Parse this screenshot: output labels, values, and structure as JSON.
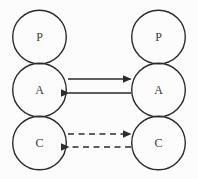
{
  "colors": {
    "background": "#fcfcfc",
    "stroke": "#2b2b2b",
    "text": "#3a3a3a"
  },
  "diagram": {
    "type": "ego-state-circles",
    "left_column": {
      "nodes": [
        {
          "label": "P"
        },
        {
          "label": "A"
        },
        {
          "label": "C"
        }
      ]
    },
    "right_column": {
      "nodes": [
        {
          "label": "P"
        },
        {
          "label": "A"
        },
        {
          "label": "C"
        }
      ]
    },
    "arrows": [
      {
        "between": "A-A",
        "style": "solid",
        "direction": "right"
      },
      {
        "between": "A-A",
        "style": "solid",
        "direction": "left"
      },
      {
        "between": "C-C",
        "style": "dashed",
        "direction": "right"
      },
      {
        "between": "C-C",
        "style": "dashed",
        "direction": "left"
      }
    ]
  }
}
